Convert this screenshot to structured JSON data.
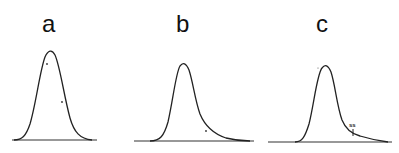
{
  "panels": [
    {
      "label": "a",
      "shape": "symmetric peak"
    },
    {
      "label": "b",
      "shape": "right-skewed peak"
    },
    {
      "label": "c",
      "shape": "peak with extended right tail",
      "annotation": "ss"
    }
  ]
}
